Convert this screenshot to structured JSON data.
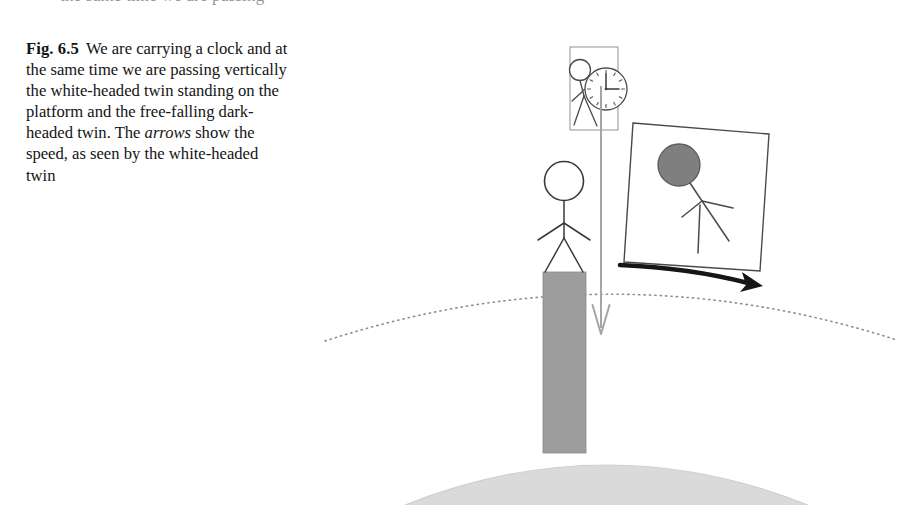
{
  "page": {
    "background_color": "#ffffff",
    "width": 907,
    "height": 505,
    "top_cut_text": "the same time we are passing"
  },
  "caption": {
    "figure_label": "Fig. 6.5",
    "text_part_1": "We are carrying a clock and at the same time we are passing vertically the white-headed twin standing on the platform and the free-falling dark-headed twin. The ",
    "emphasis": "arrows",
    "text_part_2": " show the speed, as seen by the white-headed twin",
    "full_text": "Fig. 6.5 We are carrying a clock and at the same time we are passing vertically the white-headed twin standing on the platform and the free-falling dark-headed twin. The arrows show the speed, as seen by the white-headed twin"
  },
  "figure": {
    "type": "line-drawing",
    "colors": {
      "ink": "#2b2b2b",
      "platform_gray": "#9a9a9a",
      "ground_gray": "#d8d8d8",
      "arrow_gray": "#a0a0a0",
      "dark_head": "#7d7d7d",
      "dotted_line": "#8a8a8a",
      "black_arrow": "#1a1a1a"
    },
    "elements": {
      "observer_box": {
        "label": "observer-frame-box",
        "x": 570,
        "y": 47,
        "width": 48,
        "height": 83,
        "contents": "white-headed stick figure holding a clock"
      },
      "clock": {
        "label": "clock-face",
        "cx": 606,
        "cy": 89,
        "r": 21,
        "hour_hand": "3",
        "minute_hand": "12",
        "tick_count": 12
      },
      "observer_figure": {
        "label": "observer-stick-figure",
        "head_cx": 580,
        "head_cy": 70,
        "head_r": 11,
        "head_fill": "white"
      },
      "vertical_speed_arrow": {
        "label": "downward-speed-arrow",
        "x": 601,
        "y_start": 88,
        "y_end": 335,
        "color": "#a0a0a0",
        "direction": "down"
      },
      "falling_box": {
        "label": "free-falling-frame-box",
        "corners": [
          [
            633,
            123
          ],
          [
            769,
            134
          ],
          [
            760,
            271
          ],
          [
            624,
            262
          ]
        ],
        "rotation_deg": 4.2,
        "contents": "dark-headed stick figure free-falling"
      },
      "falling_figure": {
        "label": "falling-stick-figure",
        "head_cx": 679,
        "head_cy": 165,
        "head_r": 21,
        "head_fill": "#7d7d7d"
      },
      "curved_speed_arrow": {
        "label": "horizontal-speed-arrow",
        "from": [
          621,
          266
        ],
        "to": [
          757,
          286
        ],
        "color": "#1a1a1a",
        "direction": "right"
      },
      "standing_twin": {
        "label": "white-headed-twin",
        "head_cx": 564,
        "head_cy": 180,
        "head_r": 19,
        "head_fill": "white",
        "stands_on": "platform"
      },
      "platform": {
        "label": "platform-column",
        "x": 543,
        "y": 272,
        "width": 43,
        "height": 180,
        "fill": "#9a9a9a"
      },
      "horizon_arc": {
        "label": "dotted-horizon-arc",
        "style": "dotted",
        "from_x": 325,
        "to_x": 895,
        "apex_y": 272
      },
      "ground": {
        "label": "earth-surface-arc",
        "from_x": 415,
        "to_x": 800,
        "apex_y": 445,
        "fill": "#d8d8d8"
      }
    }
  }
}
